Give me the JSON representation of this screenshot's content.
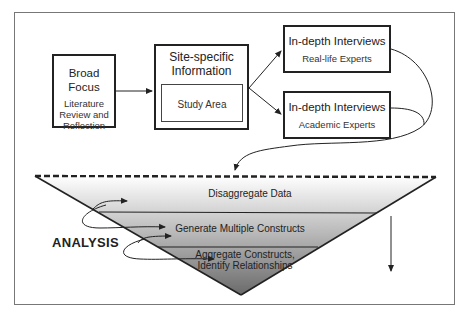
{
  "diagram": {
    "broad_focus": {
      "title": "Broad Focus",
      "subtitle_lines": [
        "Literature",
        "Review and",
        "Reflection"
      ]
    },
    "site_specific": {
      "title_lines": [
        "Site-specific",
        "Information"
      ],
      "inner_label": "Study Area"
    },
    "interview_real": {
      "title": "In-depth Interviews",
      "subtitle": "Real-life Experts"
    },
    "interview_academic": {
      "title": "In-depth Interviews",
      "subtitle": "Academic Experts"
    },
    "funnel": {
      "levels": [
        {
          "label": "Disaggregate Data"
        },
        {
          "label": "Generate Multiple Constructs"
        },
        {
          "label_lines": [
            "Aggregate Constructs,",
            "Identify Relationships"
          ]
        }
      ],
      "side_label": "ANALYSIS"
    },
    "colors": {
      "stroke": "#222222",
      "frame": "#777777",
      "gradient_top": "#ffffff",
      "gradient_bottom": "#6e6e6e"
    }
  }
}
